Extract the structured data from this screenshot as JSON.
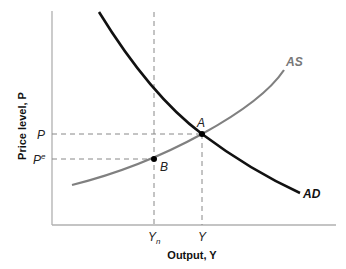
{
  "diagram": {
    "type": "AS-AD model",
    "axes": {
      "x_label": "Output, Y",
      "y_label": "Price level, P"
    },
    "x_ticks": [
      {
        "label": "Y",
        "sub": "n"
      },
      {
        "label": "Y",
        "sub": ""
      }
    ],
    "y_ticks": [
      {
        "label": "P",
        "sup": ""
      },
      {
        "label": "P",
        "sup": "e"
      }
    ],
    "curves": [
      {
        "name": "AS",
        "color": "#808080"
      },
      {
        "name": "AD",
        "color": "#111111"
      }
    ],
    "points": [
      {
        "name": "A"
      },
      {
        "name": "B"
      }
    ]
  }
}
